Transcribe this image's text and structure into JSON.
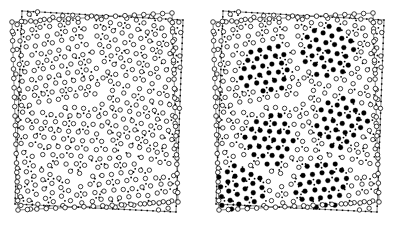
{
  "figure": {
    "kind": "scientific-figure",
    "description": "Two-panel particle configuration snapshot of a two-dimensional polycrystalline colloidal system",
    "panel_count": 2,
    "background_color": "#ffffff",
    "ink_color": "#000000",
    "width_px": 401,
    "height_px": 240
  },
  "panels": [
    {
      "id": "panel-left",
      "label": "",
      "position": "left",
      "origin_x": 0,
      "origin_y": 0,
      "width_px": 200,
      "height_px": 240,
      "caption": "",
      "marker_legend": {
        "open_circle": "particle",
        "small_filled_dot": "interstitial / lattice-site marker"
      },
      "content": {
        "all_particles_open": true,
        "highlighted_domains": 0
      },
      "box": {
        "inner_quad": [
          [
            12,
            22
          ],
          [
            172,
            13
          ],
          [
            178,
            202
          ],
          [
            18,
            210
          ]
        ],
        "outer_quad": [
          [
            22,
            11
          ],
          [
            183,
            20
          ],
          [
            176,
            212
          ],
          [
            15,
            204
          ]
        ],
        "inner_vertex_marker": "open-circle",
        "outer_vertex_marker": "small-square"
      },
      "lattice": {
        "type": "hexagonal",
        "spacing_px": 9.4,
        "domain_count": 6
      }
    },
    {
      "id": "panel-right",
      "label": "",
      "position": "right",
      "origin_x": 201,
      "origin_y": 0,
      "width_px": 200,
      "height_px": 240,
      "caption": "",
      "marker_legend": {
        "open_circle": "disordered / grain-boundary particle",
        "filled_black_dot": "crystalline (six-fold coordinated) particle",
        "small_filled_dot": "interstitial / lattice-site marker"
      },
      "content": {
        "all_particles_open": false,
        "highlighted_domains": 6
      },
      "box": {
        "inner_quad": [
          [
            12,
            22
          ],
          [
            172,
            13
          ],
          [
            178,
            202
          ],
          [
            18,
            210
          ]
        ],
        "outer_quad": [
          [
            22,
            11
          ],
          [
            183,
            20
          ],
          [
            176,
            212
          ],
          [
            15,
            204
          ]
        ],
        "inner_vertex_marker": "open-circle",
        "outer_vertex_marker": "small-square"
      },
      "lattice": {
        "type": "hexagonal",
        "spacing_px": 9.4,
        "domain_count": 6
      }
    }
  ],
  "chart_data": {
    "type": "scatter",
    "title": "",
    "subtitle": "",
    "xlabel": "",
    "ylabel": "",
    "grid": false,
    "legend_position": "none",
    "xlim": [
      0,
      200
    ],
    "ylim": [
      0,
      240
    ],
    "tick_labels_x": [],
    "tick_labels_y": [],
    "annotations": [],
    "series": [
      {
        "name": "particles-open-circle",
        "panel": "panel-left",
        "marker": "open-circle",
        "marker_radius_px": 2.2,
        "stroke": "#000000",
        "fill": "#ffffff",
        "count_estimate": 380
      },
      {
        "name": "lattice-dots",
        "panel": "panel-left",
        "marker": "filled-dot",
        "marker_radius_px": 0.9,
        "stroke": "#000000",
        "fill": "#000000",
        "count_estimate": 360
      },
      {
        "name": "particles-disordered",
        "panel": "panel-right",
        "marker": "open-circle",
        "marker_radius_px": 2.2,
        "stroke": "#000000",
        "fill": "#ffffff",
        "count_estimate": 230
      },
      {
        "name": "particles-crystalline",
        "panel": "panel-right",
        "marker": "filled-circle",
        "marker_radius_px": 2.4,
        "stroke": "#000000",
        "fill": "#000000",
        "count_estimate": 150
      },
      {
        "name": "lattice-dots",
        "panel": "panel-right",
        "marker": "filled-dot",
        "marker_radius_px": 0.9,
        "stroke": "#000000",
        "fill": "#000000",
        "count_estimate": 360
      }
    ],
    "crystalline_domain_centers_right": [
      [
        63,
        68
      ],
      [
        128,
        52
      ],
      [
        140,
        122
      ],
      [
        70,
        140
      ],
      [
        120,
        185
      ],
      [
        40,
        190
      ]
    ],
    "domain_radius_px": 33
  },
  "colors": {
    "ink": "#000000",
    "paper": "#ffffff"
  }
}
